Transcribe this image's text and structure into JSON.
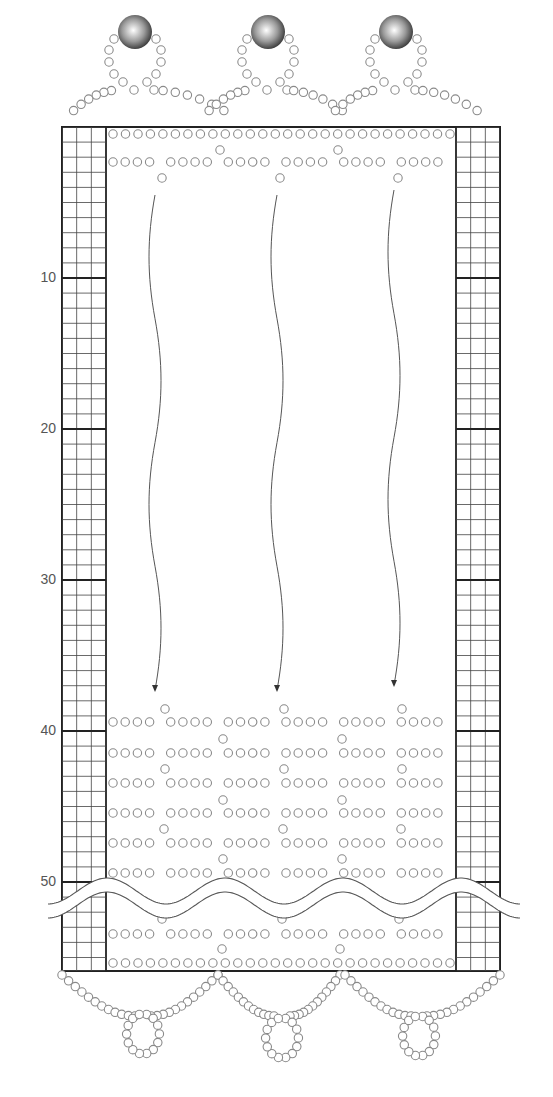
{
  "caption": "……編み図（途中省略）",
  "colors": {
    "frame": "#222222",
    "grid": "#444444",
    "bead_stroke": "#8a8a8a",
    "label": "#555555",
    "pearl_dark": "#3a3a3a",
    "pearl_light": "#ffffff"
  },
  "grid": {
    "top": 127,
    "bottom": 971,
    "row_height": 15.1,
    "left_column": {
      "x": 62,
      "width": 44,
      "cols": 3
    },
    "right_column": {
      "x": 456,
      "width": 44,
      "cols": 3
    },
    "row_labels": [
      {
        "label": "10",
        "row": 10,
        "y": 282
      },
      {
        "label": "20",
        "row": 20,
        "y": 433
      },
      {
        "label": "30",
        "row": 30,
        "y": 584
      },
      {
        "label": "40",
        "row": 40,
        "y": 735
      },
      {
        "label": "50",
        "row": 50,
        "y": 886
      }
    ]
  },
  "pearls": [
    {
      "name": "pearl-left",
      "cx": 135,
      "cy": 32,
      "r": 17
    },
    {
      "name": "pearl-center",
      "cx": 268,
      "cy": 32,
      "r": 17
    },
    {
      "name": "pearl-right",
      "cx": 396,
      "cy": 32,
      "r": 17
    }
  ],
  "arrows": [
    {
      "name": "arrow-left",
      "x": 155,
      "y_top": 195,
      "y_bottom": 690
    },
    {
      "name": "arrow-center",
      "x": 277,
      "y_top": 195,
      "y_bottom": 690
    },
    {
      "name": "arrow-right",
      "x": 394,
      "y_top": 190,
      "y_bottom": 685
    }
  ],
  "bead_rows": {
    "row_start_x": 113,
    "row_end_x": 450,
    "group_size": 4,
    "top_section": [
      {
        "type": "full",
        "y": 134
      },
      {
        "type": "drop",
        "y": 150,
        "xs": [
          220,
          338
        ]
      },
      {
        "type": "grouped",
        "y": 162
      },
      {
        "type": "drop",
        "y": 178,
        "xs": [
          162,
          280,
          398
        ]
      }
    ],
    "bottom_section": [
      {
        "type": "drop",
        "y": 709,
        "xs": [
          165,
          284,
          402
        ]
      },
      {
        "type": "grouped",
        "y": 722
      },
      {
        "type": "drop",
        "y": 739,
        "xs": [
          223,
          342
        ]
      },
      {
        "type": "grouped",
        "y": 753
      },
      {
        "type": "drop",
        "y": 769,
        "xs": [
          165,
          284,
          402
        ]
      },
      {
        "type": "grouped",
        "y": 783
      },
      {
        "type": "drop",
        "y": 800,
        "xs": [
          223,
          342
        ]
      },
      {
        "type": "grouped",
        "y": 813
      },
      {
        "type": "drop",
        "y": 829,
        "xs": [
          164,
          283,
          401
        ]
      },
      {
        "type": "grouped",
        "y": 843
      },
      {
        "type": "drop",
        "y": 859,
        "xs": [
          223,
          342
        ]
      },
      {
        "type": "grouped",
        "y": 873
      },
      {
        "type": "drop",
        "y": 919,
        "xs": [
          162,
          282,
          399
        ]
      },
      {
        "type": "grouped",
        "y": 934
      },
      {
        "type": "drop",
        "y": 949,
        "xs": [
          222,
          340
        ]
      },
      {
        "type": "full",
        "y": 963
      }
    ]
  },
  "wave_break": {
    "y": 898,
    "amplitude": 13,
    "wavelength": 118,
    "x_start": 48,
    "x_end": 520,
    "gap": 14
  },
  "top_scallops": [
    {
      "cx": 135,
      "base_left": 66,
      "base_right": 236
    },
    {
      "cx": 268,
      "base_left": 202,
      "base_right": 352
    },
    {
      "cx": 396,
      "base_left": 328,
      "base_right": 488
    }
  ],
  "bottom_loops": [
    {
      "left": 62,
      "right": 218,
      "loop_cx": 143,
      "loop_cy": 1034
    },
    {
      "left": 218,
      "right": 340,
      "loop_cx": 282,
      "loop_cy": 1038
    },
    {
      "left": 345,
      "right": 500,
      "loop_cx": 419,
      "loop_cy": 1036
    }
  ]
}
